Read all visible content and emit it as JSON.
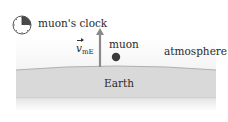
{
  "diagram": {
    "clock_label": "muon's clock",
    "muon_label": "muon",
    "atmosphere_label": "atmosphere",
    "earth_label": "Earth",
    "velocity_label": {
      "symbol": "v",
      "subscript": "mE"
    }
  },
  "colors": {
    "earth_fill": "#d6d6d6",
    "earth_edge": "#b4b4b4",
    "arrow": "#8a8a8a",
    "muon_dot": "#3a3a3a",
    "clock_wedge": "#4a4a4a",
    "text": "#2a2a2a"
  }
}
